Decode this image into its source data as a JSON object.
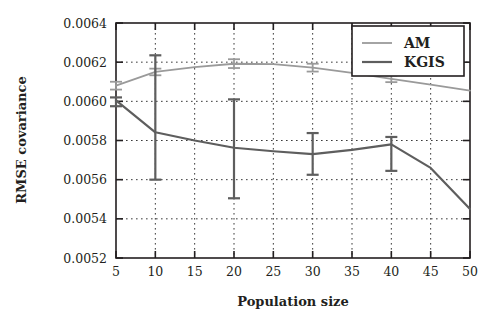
{
  "chart_data": {
    "type": "line",
    "title": "",
    "xlabel": "Population size",
    "ylabel": "RMSE covariance",
    "xlim": [
      5,
      50
    ],
    "ylim": [
      0.0052,
      0.0064
    ],
    "xticks": [
      5,
      10,
      15,
      20,
      25,
      30,
      35,
      40,
      45,
      50
    ],
    "xticklabels": [
      "5",
      "10",
      "15",
      "20",
      "25",
      "30",
      "35",
      "40",
      "45",
      "50"
    ],
    "yticks": [
      0.0052,
      0.0054,
      0.0056,
      0.0058,
      0.006,
      0.0062,
      0.0064
    ],
    "yticklabels": [
      "0.0052",
      "0.0054",
      "0.0056",
      "0.0058",
      "0.0060",
      "0.0062",
      "0.0064"
    ],
    "grid": true,
    "grid_style": "dotted",
    "legend_position": "upper right",
    "series": [
      {
        "name": "AM",
        "color": "#9a9a9a",
        "x": [
          5,
          10,
          15,
          20,
          25,
          30,
          35,
          40,
          45,
          50
        ],
        "values": [
          0.00608,
          0.00615,
          0.006175,
          0.006192,
          0.00619,
          0.006172,
          0.006145,
          0.006115,
          0.006085,
          0.006055
        ],
        "errorbars": [
          {
            "x": 5,
            "y": 0.00608,
            "lower": 0.00606,
            "upper": 0.0061
          },
          {
            "x": 10,
            "y": 0.00615,
            "lower": 0.006133,
            "upper": 0.006167
          },
          {
            "x": 20,
            "y": 0.006192,
            "lower": 0.00617,
            "upper": 0.006215
          },
          {
            "x": 30,
            "y": 0.006172,
            "lower": 0.006152,
            "upper": 0.006192
          },
          {
            "x": 40,
            "y": 0.006115,
            "lower": 0.006098,
            "upper": 0.006132
          }
        ]
      },
      {
        "name": "KGIS",
        "color": "#5e5e5e",
        "x": [
          5,
          10,
          15,
          20,
          25,
          30,
          35,
          40,
          45,
          50
        ],
        "values": [
          0.006005,
          0.005842,
          0.0058,
          0.005763,
          0.005745,
          0.00573,
          0.005752,
          0.00578,
          0.00566,
          0.00545
        ],
        "errorbars": [
          {
            "x": 5,
            "y": 0.006005,
            "lower": 0.005975,
            "upper": 0.00602
          },
          {
            "x": 10,
            "y": 0.005842,
            "lower": 0.0056,
            "upper": 0.006235
          },
          {
            "x": 20,
            "y": 0.005763,
            "lower": 0.005505,
            "upper": 0.00601
          },
          {
            "x": 30,
            "y": 0.00573,
            "lower": 0.005625,
            "upper": 0.005838
          },
          {
            "x": 40,
            "y": 0.00578,
            "lower": 0.005645,
            "upper": 0.005818
          }
        ]
      }
    ]
  },
  "legend": {
    "entries": [
      {
        "label": "AM"
      },
      {
        "label": "KGIS"
      }
    ]
  }
}
